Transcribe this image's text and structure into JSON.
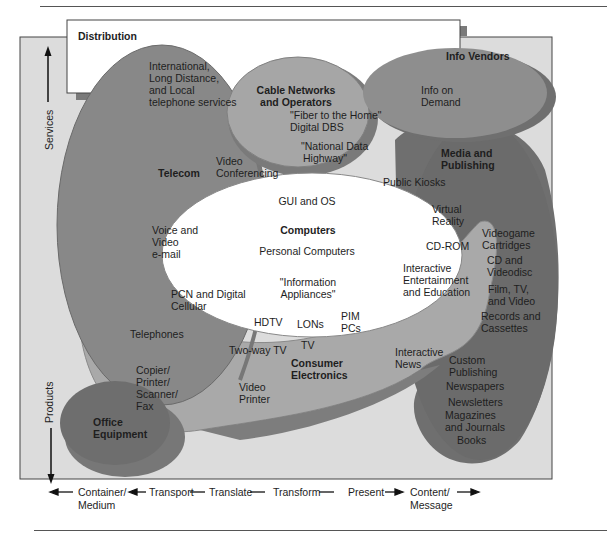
{
  "figure": {
    "distribution_label": "Distribution",
    "axes": {
      "vertical_top": "Services",
      "vertical_bottom": "Products",
      "horizontal": [
        "Container/",
        "Medium",
        "Transport",
        "Translate",
        "Transform",
        "Present",
        "Content/",
        "Message"
      ]
    },
    "regions": {
      "telecom": {
        "title": "Telecom",
        "items": [
          "International,",
          "Long Distance,",
          "and Local",
          "telephone services",
          "Video",
          "Conferencing",
          "Voice and",
          "Video",
          "e-mail",
          "PCN and Digital",
          "Cellular",
          "Telephones",
          "Copier/",
          "Printer/",
          "Scanner/",
          "Fax"
        ]
      },
      "cable": {
        "title_line1": "Cable Networks",
        "title_line2": "and Operators",
        "items": [
          "\"Fiber to the Home\"",
          "Digital DBS",
          "\"National Data",
          "Highway\""
        ]
      },
      "info_vendors": {
        "title": "Info Vendors",
        "items": [
          "Info on",
          "Demand"
        ]
      },
      "media": {
        "title_line1": "Media and",
        "title_line2": "Publishing",
        "items": [
          "Public Kiosks",
          "Virtual",
          "Reality",
          "CD-ROM",
          "Interactive",
          "Entertainment",
          "and Education",
          "Videogame",
          "Cartridges",
          "CD and",
          "Videodisc",
          "Film, TV,",
          "and Video",
          "Records and",
          "Cassettes",
          "Interactive",
          "News",
          "Custom",
          "Publishing",
          "Newspapers",
          "Newsletters",
          "Magazines",
          "and Journals",
          "Books"
        ]
      },
      "computers": {
        "title": "Computers",
        "items": [
          "GUI and OS",
          "Personal Computers",
          "\"Information",
          "Appliances\""
        ]
      },
      "consumer": {
        "title_line1": "Consumer",
        "title_line2": "Electronics",
        "items": [
          "HDTV",
          "LONs",
          "PIM",
          "PCs",
          "TV",
          "Two-way TV",
          "Video",
          "Printer"
        ]
      },
      "office": {
        "title_line1": "Office",
        "title_line2": "Equipment"
      }
    }
  }
}
